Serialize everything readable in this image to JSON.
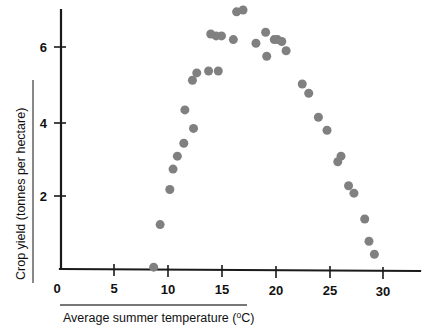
{
  "chart_data": {
    "type": "scatter",
    "title": "",
    "xlabel": "Average summer temperature (°C)",
    "ylabel": "Crop yield (tonnes per hectare)",
    "xlabel_main": "Average summer temperature (",
    "xlabel_unit_sup": "o",
    "xlabel_unit_rest": "C)",
    "xlim": [
      0,
      33
    ],
    "ylim": [
      0,
      7.3
    ],
    "xticks": [
      0,
      5,
      10,
      15,
      20,
      25,
      30
    ],
    "xticklabels": [
      "0",
      "5",
      "10",
      "15",
      "20",
      "25",
      "30"
    ],
    "yticks": [
      2,
      4,
      6
    ],
    "yticklabels": [
      "2",
      "4",
      "6"
    ],
    "grid": false,
    "legend": null,
    "marker": "circle",
    "marker_color": "#808080",
    "marker_size_px": 9,
    "points": [
      {
        "x": 8.7,
        "y": 0.05
      },
      {
        "x": 9.3,
        "y": 1.2
      },
      {
        "x": 10.2,
        "y": 2.15
      },
      {
        "x": 10.5,
        "y": 2.7
      },
      {
        "x": 10.9,
        "y": 3.05
      },
      {
        "x": 11.5,
        "y": 3.4
      },
      {
        "x": 11.6,
        "y": 4.3
      },
      {
        "x": 12.4,
        "y": 3.8
      },
      {
        "x": 12.3,
        "y": 5.1
      },
      {
        "x": 12.7,
        "y": 5.3
      },
      {
        "x": 13.8,
        "y": 5.35
      },
      {
        "x": 14.7,
        "y": 5.35
      },
      {
        "x": 14.0,
        "y": 6.35
      },
      {
        "x": 14.5,
        "y": 6.3
      },
      {
        "x": 15.0,
        "y": 6.3
      },
      {
        "x": 16.1,
        "y": 6.2
      },
      {
        "x": 16.4,
        "y": 6.95
      },
      {
        "x": 17.0,
        "y": 7.0
      },
      {
        "x": 18.2,
        "y": 6.1
      },
      {
        "x": 19.1,
        "y": 6.4
      },
      {
        "x": 19.2,
        "y": 5.75
      },
      {
        "x": 19.9,
        "y": 6.2
      },
      {
        "x": 20.2,
        "y": 6.2
      },
      {
        "x": 20.6,
        "y": 6.15
      },
      {
        "x": 21.0,
        "y": 5.9
      },
      {
        "x": 22.5,
        "y": 5.0
      },
      {
        "x": 23.1,
        "y": 4.75
      },
      {
        "x": 24.0,
        "y": 4.1
      },
      {
        "x": 24.8,
        "y": 3.75
      },
      {
        "x": 25.8,
        "y": 2.9
      },
      {
        "x": 26.1,
        "y": 3.05
      },
      {
        "x": 26.8,
        "y": 2.25
      },
      {
        "x": 27.3,
        "y": 2.05
      },
      {
        "x": 28.3,
        "y": 1.35
      },
      {
        "x": 28.7,
        "y": 0.75
      },
      {
        "x": 29.2,
        "y": 0.4
      }
    ]
  },
  "axes": {
    "y_axis_label": "Crop yield (tonnes per hectare)",
    "x_axis_label_full": "Average summer temperature (°C)",
    "origin_label": "0"
  }
}
